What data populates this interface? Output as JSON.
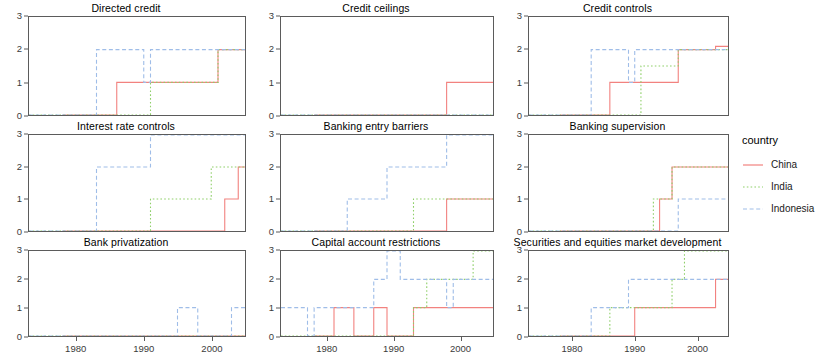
{
  "legend": {
    "title": "country",
    "entries": [
      {
        "label": "China",
        "color": "#f2827f",
        "dash": "none"
      },
      {
        "label": "India",
        "color": "#8fcf6a",
        "dash": "dotted"
      },
      {
        "label": "Indonesia",
        "color": "#9fbde8",
        "dash": "dashed"
      }
    ]
  },
  "axes": {
    "ylim": [
      0,
      3
    ],
    "yticks": [
      0,
      1,
      2,
      3
    ],
    "xlim": [
      1973,
      2005
    ],
    "xticks": [
      1980,
      1990,
      2000
    ],
    "xticklabels": [
      "1980",
      "1990",
      "2000"
    ],
    "grid": false
  },
  "chart_data": {
    "type": "line",
    "title": "",
    "xlabel": "",
    "ylabel": "",
    "xlim": [
      1973,
      2005
    ],
    "ylim": [
      0,
      3
    ],
    "legend_position": "right",
    "legend_title": "country",
    "step_interpolation": true,
    "panels": [
      {
        "title": "Directed credit",
        "series": [
          {
            "name": "China",
            "color": "#f2827f",
            "dash": "none",
            "points": [
              [
                1978,
                0
              ],
              [
                1985,
                0
              ],
              [
                1986,
                1
              ],
              [
                1993,
                1
              ],
              [
                1994,
                1
              ],
              [
                2000,
                1
              ],
              [
                2001,
                2
              ],
              [
                2005,
                2
              ]
            ]
          },
          {
            "name": "India",
            "color": "#8fcf6a",
            "dash": "dotted",
            "points": [
              [
                1973,
                0
              ],
              [
                1990,
                0
              ],
              [
                1991,
                1
              ],
              [
                2000,
                1
              ],
              [
                2001,
                2
              ],
              [
                2005,
                2
              ]
            ]
          },
          {
            "name": "Indonesia",
            "color": "#9fbde8",
            "dash": "dashed",
            "points": [
              [
                1973,
                0
              ],
              [
                1982,
                0
              ],
              [
                1983,
                2
              ],
              [
                1989,
                2
              ],
              [
                1990,
                1
              ],
              [
                1991,
                2
              ],
              [
                2005,
                2
              ]
            ]
          }
        ]
      },
      {
        "title": "Credit ceilings",
        "series": [
          {
            "name": "China",
            "color": "#f2827f",
            "dash": "none",
            "points": [
              [
                1978,
                0
              ],
              [
                1997,
                0
              ],
              [
                1998,
                1
              ],
              [
                2005,
                1
              ]
            ]
          },
          {
            "name": "India",
            "color": "#8fcf6a",
            "dash": "dotted",
            "points": [
              [
                1973,
                0
              ],
              [
                2005,
                0
              ]
            ]
          },
          {
            "name": "Indonesia",
            "color": "#9fbde8",
            "dash": "dashed",
            "points": [
              [
                1973,
                0
              ],
              [
                2005,
                0
              ]
            ]
          }
        ]
      },
      {
        "title": "Credit controls",
        "series": [
          {
            "name": "China",
            "color": "#f2827f",
            "dash": "none",
            "points": [
              [
                1978,
                0
              ],
              [
                1985,
                0
              ],
              [
                1986,
                1
              ],
              [
                1996,
                1
              ],
              [
                1997,
                2
              ],
              [
                2002,
                2
              ],
              [
                2003,
                2.1
              ],
              [
                2005,
                2.1
              ]
            ]
          },
          {
            "name": "India",
            "color": "#8fcf6a",
            "dash": "dotted",
            "points": [
              [
                1973,
                0
              ],
              [
                1990,
                0
              ],
              [
                1991,
                1.5
              ],
              [
                1996,
                1.5
              ],
              [
                1997,
                2
              ],
              [
                2005,
                2
              ]
            ]
          },
          {
            "name": "Indonesia",
            "color": "#9fbde8",
            "dash": "dashed",
            "points": [
              [
                1973,
                0
              ],
              [
                1982,
                0
              ],
              [
                1983,
                2
              ],
              [
                1988,
                2
              ],
              [
                1989,
                1
              ],
              [
                1990,
                2
              ],
              [
                2005,
                2
              ]
            ]
          }
        ]
      },
      {
        "title": "Interest rate controls",
        "series": [
          {
            "name": "China",
            "color": "#f2827f",
            "dash": "none",
            "points": [
              [
                1978,
                0
              ],
              [
                2001,
                0
              ],
              [
                2002,
                1
              ],
              [
                2003,
                1
              ],
              [
                2004,
                2
              ],
              [
                2005,
                2
              ]
            ]
          },
          {
            "name": "India",
            "color": "#8fcf6a",
            "dash": "dotted",
            "points": [
              [
                1973,
                0
              ],
              [
                1990,
                0
              ],
              [
                1991,
                1
              ],
              [
                1999,
                1
              ],
              [
                2000,
                2
              ],
              [
                2005,
                2
              ]
            ]
          },
          {
            "name": "Indonesia",
            "color": "#9fbde8",
            "dash": "dashed",
            "points": [
              [
                1973,
                0
              ],
              [
                1982,
                0
              ],
              [
                1983,
                2
              ],
              [
                1990,
                2
              ],
              [
                1991,
                3
              ],
              [
                2005,
                3
              ]
            ]
          }
        ]
      },
      {
        "title": "Banking entry barriers",
        "series": [
          {
            "name": "China",
            "color": "#f2827f",
            "dash": "none",
            "points": [
              [
                1978,
                0
              ],
              [
                1997,
                0
              ],
              [
                1998,
                1
              ],
              [
                2005,
                1
              ]
            ]
          },
          {
            "name": "India",
            "color": "#8fcf6a",
            "dash": "dotted",
            "points": [
              [
                1973,
                0
              ],
              [
                1992,
                0
              ],
              [
                1993,
                1
              ],
              [
                2005,
                1
              ]
            ]
          },
          {
            "name": "Indonesia",
            "color": "#9fbde8",
            "dash": "dashed",
            "points": [
              [
                1973,
                0
              ],
              [
                1982,
                0
              ],
              [
                1983,
                1
              ],
              [
                1988,
                1
              ],
              [
                1989,
                2
              ],
              [
                1997,
                2
              ],
              [
                1998,
                3
              ],
              [
                2005,
                3
              ]
            ]
          }
        ]
      },
      {
        "title": "Banking supervision",
        "series": [
          {
            "name": "China",
            "color": "#f2827f",
            "dash": "none",
            "points": [
              [
                1978,
                0
              ],
              [
                1993,
                0
              ],
              [
                1994,
                1
              ],
              [
                1995,
                1
              ],
              [
                1996,
                2
              ],
              [
                2005,
                2
              ]
            ]
          },
          {
            "name": "India",
            "color": "#8fcf6a",
            "dash": "dotted",
            "points": [
              [
                1973,
                0
              ],
              [
                1992,
                0
              ],
              [
                1993,
                1
              ],
              [
                1995,
                1
              ],
              [
                1996,
                2
              ],
              [
                2005,
                2
              ]
            ]
          },
          {
            "name": "Indonesia",
            "color": "#9fbde8",
            "dash": "dashed",
            "points": [
              [
                1973,
                0
              ],
              [
                1996,
                0
              ],
              [
                1997,
                1
              ],
              [
                2005,
                1
              ]
            ]
          }
        ]
      },
      {
        "title": "Bank privatization",
        "series": [
          {
            "name": "China",
            "color": "#f2827f",
            "dash": "none",
            "points": [
              [
                1978,
                0
              ],
              [
                2005,
                0
              ]
            ]
          },
          {
            "name": "India",
            "color": "#8fcf6a",
            "dash": "dotted",
            "points": [
              [
                1973,
                0
              ],
              [
                2005,
                0
              ]
            ]
          },
          {
            "name": "Indonesia",
            "color": "#9fbde8",
            "dash": "dashed",
            "points": [
              [
                1973,
                0
              ],
              [
                1994,
                0
              ],
              [
                1995,
                1
              ],
              [
                1997,
                1
              ],
              [
                1998,
                0
              ],
              [
                2002,
                0
              ],
              [
                2003,
                1
              ],
              [
                2005,
                1
              ]
            ]
          }
        ]
      },
      {
        "title": "Capital account restrictions",
        "series": [
          {
            "name": "China",
            "color": "#f2827f",
            "dash": "none",
            "points": [
              [
                1978,
                0
              ],
              [
                1980,
                0
              ],
              [
                1981,
                1
              ],
              [
                1983,
                1
              ],
              [
                1984,
                0
              ],
              [
                1986,
                0
              ],
              [
                1987,
                1
              ],
              [
                1988,
                1
              ],
              [
                1989,
                0
              ],
              [
                1992,
                0
              ],
              [
                1993,
                1
              ],
              [
                2005,
                1
              ]
            ]
          },
          {
            "name": "India",
            "color": "#8fcf6a",
            "dash": "dotted",
            "points": [
              [
                1973,
                0
              ],
              [
                1992,
                0
              ],
              [
                1993,
                1
              ],
              [
                1994,
                1
              ],
              [
                1995,
                2
              ],
              [
                1996,
                2
              ],
              [
                1997,
                2
              ],
              [
                1998,
                2
              ],
              [
                2001,
                2
              ],
              [
                2002,
                3
              ],
              [
                2005,
                3
              ]
            ]
          },
          {
            "name": "Indonesia",
            "color": "#9fbde8",
            "dash": "dashed",
            "points": [
              [
                1973,
                1
              ],
              [
                1976,
                1
              ],
              [
                1977,
                0
              ],
              [
                1978,
                1
              ],
              [
                1986,
                1
              ],
              [
                1987,
                2
              ],
              [
                1989,
                3
              ],
              [
                1990,
                3
              ],
              [
                1991,
                2
              ],
              [
                1996,
                2
              ],
              [
                1997,
                2
              ],
              [
                1998,
                1
              ],
              [
                1999,
                2
              ],
              [
                2005,
                2
              ]
            ]
          }
        ]
      },
      {
        "title": "Securities and equities market development",
        "series": [
          {
            "name": "China",
            "color": "#f2827f",
            "dash": "none",
            "points": [
              [
                1978,
                0
              ],
              [
                1986,
                0
              ],
              [
                1987,
                0
              ],
              [
                1989,
                0
              ],
              [
                1990,
                1
              ],
              [
                2002,
                1
              ],
              [
                2003,
                2
              ],
              [
                2005,
                2
              ]
            ]
          },
          {
            "name": "India",
            "color": "#8fcf6a",
            "dash": "dotted",
            "points": [
              [
                1973,
                0
              ],
              [
                1985,
                0
              ],
              [
                1986,
                1
              ],
              [
                1995,
                1
              ],
              [
                1996,
                2
              ],
              [
                1997,
                2
              ],
              [
                1998,
                3
              ],
              [
                2005,
                3
              ]
            ]
          },
          {
            "name": "Indonesia",
            "color": "#9fbde8",
            "dash": "dashed",
            "points": [
              [
                1973,
                0
              ],
              [
                1982,
                0
              ],
              [
                1983,
                1
              ],
              [
                1988,
                1
              ],
              [
                1989,
                2
              ],
              [
                2005,
                2
              ]
            ]
          }
        ]
      }
    ]
  }
}
